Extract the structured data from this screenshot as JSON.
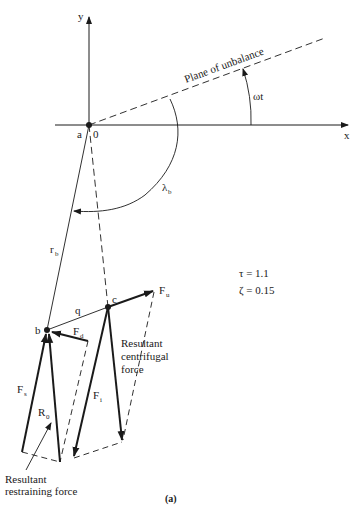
{
  "diagram": {
    "type": "vector force diagram",
    "caption": "(a)",
    "axes": {
      "x_label": "x",
      "y_label": "y",
      "origin_label_a": "a",
      "origin_label_0": "0"
    },
    "plane_label": "Plane of unbalance",
    "angles": {
      "omega_t": "ωt",
      "lambda_main": "λ",
      "lambda_sub": "b"
    },
    "points": {
      "b": "b",
      "c": "c"
    },
    "segments": {
      "r_main": "r",
      "r_sub": "b",
      "q": "q"
    },
    "forces": {
      "Fu_main": "F",
      "Fu_sub": "u",
      "Fd_main": "F",
      "Fd_sub": "d",
      "Fs_main": "F",
      "Fs_sub": "s",
      "Fi_main": "F",
      "Fi_sub": "i",
      "R0_main": "R",
      "R0_sub": "0"
    },
    "parameters": {
      "tau": "τ = 1.1",
      "zeta": "ζ = 0.15"
    },
    "annotations": {
      "centrifugal_line1": "Resultant",
      "centrifugal_line2": "centrifugal",
      "centrifugal_line3": "force",
      "restraining_line1": "Resultant",
      "restraining_line2": "restraining force"
    },
    "colors": {
      "ink": "#1a1a1a",
      "background": "#ffffff"
    }
  }
}
